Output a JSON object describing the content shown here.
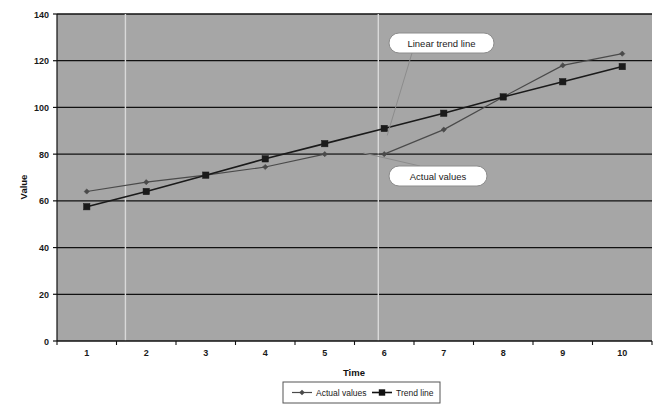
{
  "chart_data": {
    "type": "line",
    "title": "",
    "xlabel": "Time",
    "ylabel": "Value",
    "x": [
      1,
      2,
      3,
      4,
      5,
      6,
      7,
      8,
      9,
      10
    ],
    "categories": [
      "1",
      "2",
      "3",
      "4",
      "5",
      "6",
      "7",
      "8",
      "9",
      "10"
    ],
    "series": [
      {
        "name": "Actual values",
        "marker": "diamond",
        "color": "#4a4a4a",
        "values": [
          64,
          68,
          71,
          74.5,
          80,
          80,
          90.5,
          104.5,
          118,
          123
        ]
      },
      {
        "name": "Trend line",
        "marker": "square",
        "color": "#1a1a1a",
        "values": [
          57.5,
          64,
          71,
          78,
          84.5,
          91,
          97.5,
          104.5,
          111,
          117.5
        ]
      }
    ],
    "xlim": [
      0.5,
      10.5
    ],
    "ylim": [
      0,
      140
    ],
    "yticks": [
      0,
      20,
      40,
      60,
      80,
      100,
      120,
      140
    ],
    "ytick_labels": [
      "0",
      "20",
      "40",
      "60",
      "80",
      "100",
      "120",
      "140"
    ],
    "grid": "horizontal",
    "plot_background": "#a6a6a6",
    "legend_position": "bottom",
    "annotations": [
      {
        "text": "Linear trend line",
        "target_x": 6.05,
        "target_y": 88
      },
      {
        "text": "Actual values",
        "target_x": 5.65,
        "target_y": 80.5
      }
    ]
  },
  "axis": {
    "y_title": "Value",
    "x_title": "Time"
  },
  "legend": {
    "items": [
      {
        "label": "Actual values",
        "marker": "diamond"
      },
      {
        "label": "Trend line",
        "marker": "square"
      }
    ]
  },
  "colors": {
    "plot_bg": "#a6a6a6",
    "page_bg": "#ffffff",
    "gridline": "#111111",
    "series_actual": "#4a4a4a",
    "series_trend": "#111111",
    "callout_fill": "#ffffff",
    "callout_stroke": "#8c8c8c",
    "leader_line": "#8c8c8c"
  }
}
